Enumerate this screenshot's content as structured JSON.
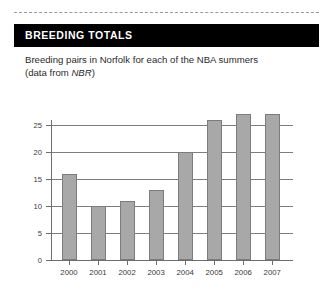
{
  "panel": {
    "title": "BREEDING TOTALS",
    "caption_line1": "Breeding pairs in Norfolk for each of the NBA summers",
    "caption_line2_prefix": "(data from ",
    "caption_line2_italic": "NBR",
    "caption_line2_suffix": ")"
  },
  "colors": {
    "header_background": "#000000",
    "header_text": "#ffffff",
    "bar_fill": "#a8a8a8",
    "bar_stroke": "#7c7c7c",
    "grid": "#7d7d7d",
    "axis": "#6d6d6d",
    "page_background": "#ffffff"
  },
  "chart_data": {
    "type": "bar",
    "title": "",
    "subtitle": "",
    "xlabel": "",
    "ylabel": "",
    "categories": [
      "2000",
      "2001",
      "2002",
      "2003",
      "2004",
      "2005",
      "2006",
      "2007"
    ],
    "values": [
      16,
      10,
      11,
      13,
      20,
      26,
      27,
      27
    ],
    "ylim": [
      0,
      27
    ],
    "yticks": [
      0,
      5,
      10,
      15,
      20,
      25
    ],
    "ytick_labels": [
      "0",
      "5",
      "10",
      "15",
      "20",
      "25"
    ],
    "gridlines": [
      5,
      10,
      15,
      20,
      25
    ],
    "grid": true,
    "legend": false,
    "legend_position": "none"
  }
}
